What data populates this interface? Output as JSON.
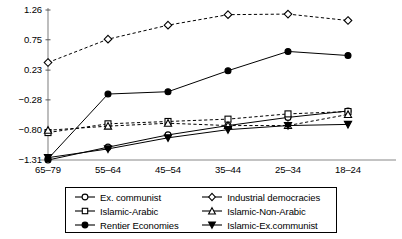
{
  "chart_data": {
    "type": "line",
    "title": "",
    "xlabel": "",
    "ylabel": "",
    "categories": [
      "65–79",
      "55–64",
      "45–54",
      "35–44",
      "25–34",
      "18–24"
    ],
    "yticks": [
      1.26,
      0.75,
      0.23,
      -0.28,
      -0.8,
      -1.31
    ],
    "ytick_labels": [
      "1.26",
      "0.75",
      "0.23",
      "−0.28",
      "−0.80",
      "−1.31"
    ],
    "xtick_labels": [
      "65–79",
      "55–64",
      "45–54",
      "35–44",
      "25–34",
      "18–24"
    ],
    "ylim": [
      -1.31,
      1.26
    ],
    "grid": false,
    "legend_position": "bottom",
    "series": [
      {
        "name": "Ex. communist",
        "marker": "circle-open",
        "line": "solid",
        "color": "#000000",
        "values": [
          -1.31,
          -1.09,
          -0.88,
          -0.72,
          -0.58,
          -0.47
        ]
      },
      {
        "name": "Industrial democracies",
        "marker": "diamond-open",
        "line": "dashed",
        "color": "#000000",
        "values": [
          0.36,
          0.76,
          1.0,
          1.18,
          1.19,
          1.08
        ]
      },
      {
        "name": "Islamic-Arabic",
        "marker": "square-open",
        "line": "dashed",
        "color": "#000000",
        "values": [
          -0.84,
          -0.69,
          -0.65,
          -0.61,
          -0.52,
          -0.48
        ]
      },
      {
        "name": "Islamic-Non-Arabic",
        "marker": "triangle-open",
        "line": "dashed",
        "color": "#000000",
        "values": [
          -0.8,
          -0.73,
          -0.68,
          -0.72,
          -0.72,
          -0.53
        ]
      },
      {
        "name": "Rentier Economies",
        "marker": "circle-filled",
        "line": "solid",
        "color": "#000000",
        "values": [
          -1.29,
          -0.18,
          -0.14,
          0.22,
          0.55,
          0.48
        ]
      },
      {
        "name": "Islamic-Ex.communist",
        "marker": "triangle-down-filled",
        "line": "solid",
        "color": "#000000",
        "values": [
          -1.27,
          -1.12,
          -0.93,
          -0.79,
          -0.72,
          -0.7
        ]
      }
    ]
  },
  "legend": {
    "rows": [
      {
        "left": "Ex. communist",
        "right": "Industrial democracies"
      },
      {
        "left": "Islamic-Arabic",
        "right": "Islamic-Non-Arabic"
      },
      {
        "left": "Rentier Economies",
        "right": "Islamic-Ex.communist"
      }
    ]
  }
}
